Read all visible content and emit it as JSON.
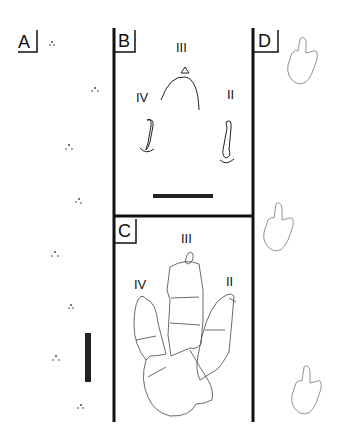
{
  "panels": {
    "A": {
      "label": "A",
      "content": "trackway-of-small-footprints",
      "footprint_count": 9,
      "scale_bar": "vertical"
    },
    "B": {
      "label": "B",
      "digits": {
        "left": "IV",
        "center": "III",
        "right": "II"
      },
      "scale_bar": "horizontal"
    },
    "C": {
      "label": "C",
      "digits": {
        "left": "IV",
        "center": "III",
        "right": "II"
      }
    },
    "D": {
      "label": "D",
      "content": "three-footprint-outlines"
    }
  },
  "colors": {
    "line": "#111111",
    "outline": "#555555",
    "background": "#ffffff"
  }
}
